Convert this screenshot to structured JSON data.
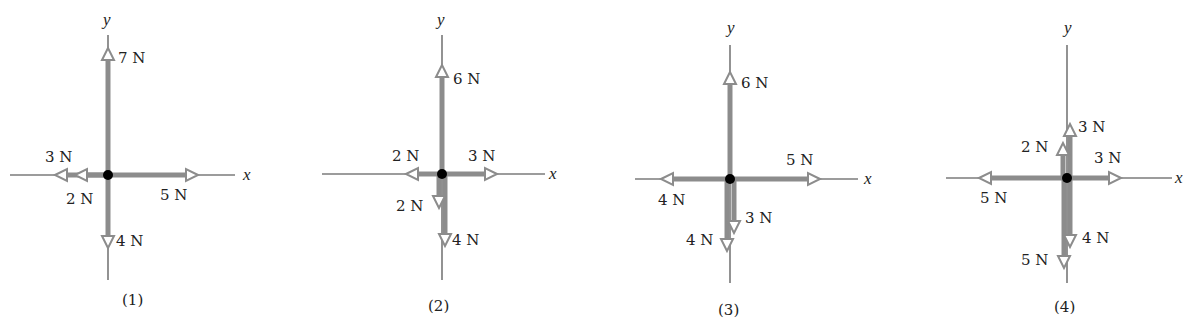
{
  "colors": {
    "arrow": "#8c8c8c",
    "axis": "#3a3a3a",
    "text": "#222222",
    "dot": "#000000"
  },
  "axis_labels": {
    "x": "x",
    "y": "y"
  },
  "diagrams": [
    {
      "caption": "(1)",
      "center": [
        108,
        175
      ],
      "x_axis": [
        10,
        235
      ],
      "y_axis": [
        35,
        280
      ],
      "x_label_pos": [
        243,
        180
      ],
      "y_label_pos": [
        103,
        25
      ],
      "caption_pos": [
        122,
        305
      ],
      "forces": [
        {
          "label": "7 N",
          "dir": "up",
          "magnitude": 7,
          "off": 0,
          "tip": 48,
          "lpos": [
            118,
            63
          ]
        },
        {
          "label": "5 N",
          "dir": "right",
          "magnitude": 5,
          "off": 0,
          "tip": 198,
          "lpos": [
            160,
            200
          ]
        },
        {
          "label": "3 N",
          "dir": "left",
          "magnitude": 3,
          "off": 0,
          "tip": 55,
          "lpos": [
            45,
            162
          ]
        },
        {
          "label": "2 N",
          "dir": "left",
          "magnitude": 2,
          "off": 0,
          "tip": 75,
          "lpos": [
            66,
            204
          ]
        },
        {
          "label": "4 N",
          "dir": "down",
          "magnitude": 4,
          "off": 0,
          "tip": 248,
          "lpos": [
            116,
            246
          ]
        }
      ]
    },
    {
      "caption": "(2)",
      "center": [
        442,
        174
      ],
      "x_axis": [
        322,
        545
      ],
      "y_axis": [
        35,
        280
      ],
      "x_label_pos": [
        549,
        179
      ],
      "y_label_pos": [
        437,
        25
      ],
      "caption_pos": [
        428,
        311
      ],
      "forces": [
        {
          "label": "6 N",
          "dir": "up",
          "magnitude": 6,
          "off": 0,
          "tip": 65,
          "lpos": [
            453,
            84
          ]
        },
        {
          "label": "3 N",
          "dir": "right",
          "magnitude": 3,
          "off": 0,
          "tip": 497,
          "lpos": [
            468,
            161
          ]
        },
        {
          "label": "2 N",
          "dir": "left",
          "magnitude": 2,
          "off": 0,
          "tip": 406,
          "lpos": [
            392,
            161
          ]
        },
        {
          "label": "2 N",
          "dir": "down",
          "magnitude": 2,
          "off": -3,
          "tip": 208,
          "lpos": [
            396,
            211
          ]
        },
        {
          "label": "4 N",
          "dir": "down",
          "magnitude": 4,
          "off": 3,
          "tip": 246,
          "lpos": [
            452,
            245
          ]
        }
      ]
    },
    {
      "caption": "(3)",
      "center": [
        730,
        179
      ],
      "x_axis": [
        635,
        858
      ],
      "y_axis": [
        45,
        283
      ],
      "x_label_pos": [
        864,
        184
      ],
      "y_label_pos": [
        727,
        33
      ],
      "caption_pos": [
        718,
        315
      ],
      "forces": [
        {
          "label": "6 N",
          "dir": "up",
          "magnitude": 6,
          "off": 0,
          "tip": 72,
          "lpos": [
            741,
            88
          ]
        },
        {
          "label": "5 N",
          "dir": "right",
          "magnitude": 5,
          "off": 0,
          "tip": 820,
          "lpos": [
            786,
            165
          ]
        },
        {
          "label": "4 N",
          "dir": "left",
          "magnitude": 4,
          "off": 0,
          "tip": 661,
          "lpos": [
            658,
            205
          ]
        },
        {
          "label": "3 N",
          "dir": "down",
          "magnitude": 3,
          "off": 4,
          "tip": 233,
          "lpos": [
            745,
            223
          ]
        },
        {
          "label": "4 N",
          "dir": "down",
          "magnitude": 4,
          "off": -3,
          "tip": 251,
          "lpos": [
            686,
            245
          ]
        }
      ]
    },
    {
      "caption": "(4)",
      "center": [
        1067,
        178
      ],
      "x_axis": [
        946,
        1172
      ],
      "y_axis": [
        45,
        283
      ],
      "x_label_pos": [
        1175,
        183
      ],
      "y_label_pos": [
        1064,
        33
      ],
      "caption_pos": [
        1054,
        312
      ],
      "forces": [
        {
          "label": "3 N",
          "dir": "up",
          "magnitude": 3,
          "off": 3,
          "tip": 124,
          "lpos": [
            1078,
            132
          ]
        },
        {
          "label": "2 N",
          "dir": "up",
          "magnitude": 2,
          "off": -4,
          "tip": 143,
          "lpos": [
            1021,
            152
          ]
        },
        {
          "label": "3 N",
          "dir": "right",
          "magnitude": 3,
          "off": 0,
          "tip": 1121,
          "lpos": [
            1094,
            163
          ]
        },
        {
          "label": "5 N",
          "dir": "left",
          "magnitude": 5,
          "off": 0,
          "tip": 979,
          "lpos": [
            980,
            203
          ]
        },
        {
          "label": "4 N",
          "dir": "down",
          "magnitude": 4,
          "off": 3,
          "tip": 247,
          "lpos": [
            1082,
            243
          ]
        },
        {
          "label": "5 N",
          "dir": "down",
          "magnitude": 5,
          "off": -3,
          "tip": 268,
          "lpos": [
            1021,
            265
          ]
        }
      ]
    }
  ]
}
